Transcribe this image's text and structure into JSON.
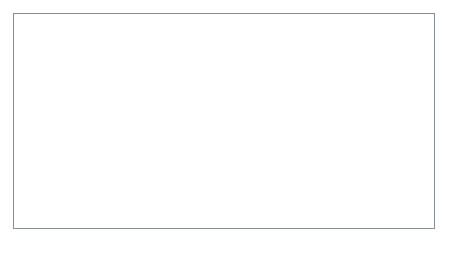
{
  "figure": {
    "caption": "A chain of circles whose centers follow an S-shaped sinusoidal path, shading from near-white at the left to near-black at the right, ending in a tight dark curl.",
    "background_color": "#ffffff",
    "frame": {
      "border_color": "#888f94",
      "border_width_px": 1,
      "x": 13,
      "y": 13,
      "width": 422,
      "height": 216
    },
    "canvas": {
      "width": 450,
      "height": 256
    }
  },
  "chart_data": {
    "type": "scatter",
    "subtitle": "",
    "xlabel": "",
    "ylabel": "",
    "grid": false,
    "legend": "none",
    "xlim": [
      13,
      435
    ],
    "ylim": [
      13,
      229
    ],
    "circle_count": 96,
    "stroke_width_px": 2.1,
    "gray_start_hex": "#f2f2f2",
    "gray_end_hex": "#1a1a1a",
    "path_model": {
      "t_range": [
        0,
        1
      ],
      "cx_expr": "38 + 352*t + 26*sin(2*pi*t)",
      "cy_expr": "118 - 34*cos(2*pi*t) - 10*sin(4*pi*t)",
      "radius_expr": "30 + 34*t - 22*t*t",
      "gray_expr": "242 - 230*t"
    },
    "series": [
      {
        "name": "coil-circles",
        "x": [
          38,
          45,
          53,
          61,
          69,
          78,
          86,
          95,
          104,
          113,
          122,
          131,
          140,
          149,
          158,
          167,
          176,
          185,
          194,
          203,
          212,
          221,
          230,
          239,
          248,
          257,
          266,
          275,
          284,
          293,
          302,
          311,
          320,
          329,
          338,
          347,
          356,
          364,
          372,
          380,
          388,
          395,
          402,
          409,
          415,
          420,
          424,
          427
        ],
        "y": [
          84,
          82,
          81,
          80,
          80,
          81,
          83,
          86,
          90,
          95,
          100,
          106,
          112,
          119,
          126,
          133,
          140,
          147,
          154,
          161,
          167,
          173,
          178,
          182,
          186,
          189,
          191,
          192,
          192,
          191,
          189,
          186,
          182,
          177,
          171,
          165,
          158,
          151,
          144,
          137,
          131,
          125,
          120,
          116,
          113,
          111,
          110,
          110
        ],
        "r": [
          30,
          31,
          32,
          33,
          34,
          35,
          37,
          38,
          39,
          40,
          41,
          42,
          43,
          44,
          44,
          45,
          46,
          46,
          47,
          47,
          48,
          48,
          48,
          48,
          48,
          48,
          48,
          48,
          47,
          47,
          46,
          46,
          45,
          44,
          43,
          42,
          41,
          40,
          39,
          38,
          37,
          36,
          35,
          34,
          33,
          32,
          31,
          30
        ],
        "gray": [
          "#f2f2f2",
          "#eeeeee",
          "#ebebeb",
          "#e7e7e7",
          "#e3e3e3",
          "#e0e0e0",
          "#dcdcdc",
          "#d8d8d8",
          "#d5d5d5",
          "#d1d1d1",
          "#cecece",
          "#cacaca",
          "#c6c6c6",
          "#c3c3c3",
          "#bfbfbf",
          "#bbbbbb",
          "#b8b8b8",
          "#b4b4b4",
          "#b0b0b0",
          "#adadad",
          "#a9a9a9",
          "#a5a5a5",
          "#a2a2a2",
          "#9e9e9e",
          "#9b9b9b",
          "#979797",
          "#939393",
          "#909090",
          "#8c8c8c",
          "#888888",
          "#858585",
          "#818181",
          "#7d7d7d",
          "#7a7a7a",
          "#767676",
          "#737373",
          "#6f6f6f",
          "#6b6b6b",
          "#686868",
          "#646464",
          "#606060",
          "#5d5d5d",
          "#595959",
          "#555555",
          "#525252",
          "#4e4e4e",
          "#4b4b4b",
          "#474747"
        ]
      }
    ],
    "annotations": []
  }
}
